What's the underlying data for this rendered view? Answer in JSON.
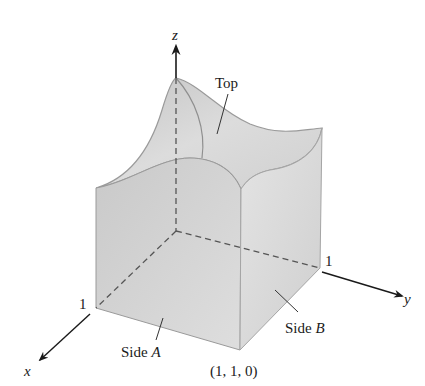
{
  "figure": {
    "axes": {
      "x_label": "x",
      "y_label": "y",
      "z_label": "z",
      "x_tick": "1",
      "y_tick": "1"
    },
    "annotations": {
      "top": "Top",
      "side_a_prefix": "Side ",
      "side_a_letter": "A",
      "side_b_prefix": "Side ",
      "side_b_letter": "B",
      "corner_point": "(1, 1, 0)"
    },
    "colors": {
      "side_a_fill": "#cfcfcf",
      "side_b_fill": "#dadada",
      "top_fill": "#d4d4d4",
      "edge": "#9a9a9a",
      "axis": "#1a1a1a",
      "dashed": "#555555"
    }
  }
}
